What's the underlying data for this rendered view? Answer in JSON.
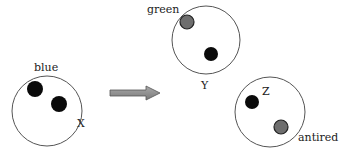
{
  "colors": {
    "ring": "#555555",
    "black_particle": "#0a0a0a",
    "gray_particle": "#6e6e6e",
    "gray_particle_stroke": "#222222",
    "arrow_fill": "#8c8c8c",
    "arrow_stroke": "#555555"
  },
  "diagram": {
    "arrow": {
      "direction": "right",
      "from": [
        110,
        93
      ],
      "to": [
        160,
        93
      ]
    },
    "nodes": [
      {
        "id": "X",
        "label": "X",
        "color_label": "blue",
        "center": [
          47,
          111
        ],
        "radius": 35,
        "particles": [
          {
            "type": "black",
            "cx": 35,
            "cy": 89,
            "r": 8
          },
          {
            "type": "black",
            "cx": 59,
            "cy": 104,
            "r": 8
          }
        ]
      },
      {
        "id": "Y",
        "label": "Y",
        "color_label": "green",
        "center": [
          206,
          40
        ],
        "radius": 34,
        "particles": [
          {
            "type": "gray",
            "cx": 187,
            "cy": 22,
            "r": 7
          },
          {
            "type": "black",
            "cx": 211,
            "cy": 54,
            "r": 7
          }
        ]
      },
      {
        "id": "Z",
        "label": "Z",
        "color_label": "antired",
        "center": [
          270,
          112
        ],
        "radius": 35,
        "particles": [
          {
            "type": "black",
            "cx": 252,
            "cy": 102,
            "r": 7
          },
          {
            "type": "gray",
            "cx": 281,
            "cy": 127,
            "r": 7
          }
        ]
      }
    ]
  },
  "labels": {
    "x_name": "X",
    "x_color": "blue",
    "y_name": "Y",
    "y_color": "green",
    "z_name": "Z",
    "z_color": "antired"
  }
}
